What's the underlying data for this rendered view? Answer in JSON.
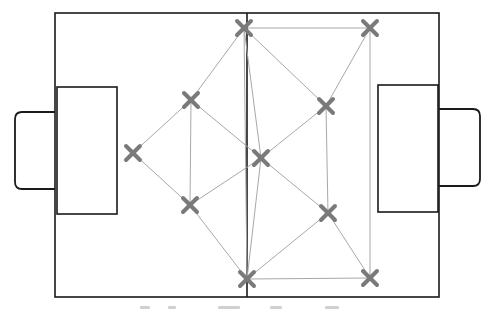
{
  "diagram": {
    "type": "passing-network-soccer-pitch",
    "colors": {
      "pitch_line": "#1a1a1a",
      "pass_line": "#a8a8a8",
      "player_marker": "#7a7a7a",
      "background": "#ffffff"
    },
    "pitch": {
      "outer": {
        "x": 55,
        "y": 13,
        "w": 384,
        "h": 284
      },
      "halfway_x": 247,
      "left_penalty_box": {
        "x": 57,
        "y": 87,
        "w": 60,
        "h": 127
      },
      "right_penalty_box": {
        "x": 378,
        "y": 85,
        "w": 60,
        "h": 127
      },
      "left_goal": {
        "x": 15,
        "y": 112,
        "w": 40,
        "h": 77
      },
      "right_goal": {
        "x": 439,
        "y": 109,
        "w": 41,
        "h": 77
      }
    },
    "players": [
      {
        "id": 1,
        "x": 244,
        "y": 28
      },
      {
        "id": 2,
        "x": 370,
        "y": 28
      },
      {
        "id": 3,
        "x": 191,
        "y": 100
      },
      {
        "id": 4,
        "x": 326,
        "y": 106
      },
      {
        "id": 5,
        "x": 133,
        "y": 153
      },
      {
        "id": 6,
        "x": 261,
        "y": 158
      },
      {
        "id": 7,
        "x": 190,
        "y": 205
      },
      {
        "id": 8,
        "x": 328,
        "y": 213
      },
      {
        "id": 9,
        "x": 247,
        "y": 279
      },
      {
        "id": 10,
        "x": 370,
        "y": 278
      }
    ],
    "passes": [
      [
        1,
        2
      ],
      [
        1,
        3
      ],
      [
        1,
        4
      ],
      [
        1,
        6
      ],
      [
        1,
        9
      ],
      [
        2,
        4
      ],
      [
        2,
        10
      ],
      [
        3,
        5
      ],
      [
        3,
        7
      ],
      [
        3,
        6
      ],
      [
        5,
        7
      ],
      [
        4,
        8
      ],
      [
        4,
        6
      ],
      [
        6,
        7
      ],
      [
        6,
        8
      ],
      [
        6,
        9
      ],
      [
        7,
        9
      ],
      [
        8,
        9
      ],
      [
        8,
        10
      ],
      [
        9,
        10
      ]
    ],
    "caption": {
      "visible": "clipped",
      "marks": [
        {
          "x": 0,
          "w": 10
        },
        {
          "x": 28,
          "w": 8
        },
        {
          "x": 78,
          "w": 22
        },
        {
          "x": 130,
          "w": 12
        },
        {
          "x": 185,
          "w": 14
        }
      ]
    }
  }
}
